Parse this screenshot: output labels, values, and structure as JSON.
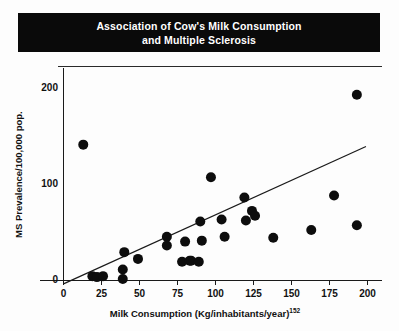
{
  "title": {
    "line1": "Association of Cow's Milk Consumption",
    "line2": "and Multiple Sclerosis",
    "background": "#0a0a0a",
    "color": "#ffffff"
  },
  "chart_data": {
    "type": "scatter",
    "title": "Association of Cow's Milk Consumption and Multiple Sclerosis",
    "xlabel": "Milk Consumption (Kg/inhabitants/year)",
    "xlabel_superscript": "152",
    "ylabel": "MS Prevalence/100,000 pop.",
    "xlim": [
      0,
      200
    ],
    "ylim": [
      0,
      220
    ],
    "xticks": [
      0,
      25,
      50,
      75,
      100,
      125,
      150,
      175,
      200
    ],
    "xticklabels": [
      "0",
      "25",
      "50",
      "75",
      "100",
      "125",
      "150",
      "175",
      "200"
    ],
    "yticks": [
      0,
      100,
      200
    ],
    "yticklabels": [
      "0",
      "100",
      "200"
    ],
    "grid": false,
    "legend": null,
    "marker_color": "#0d0d0d",
    "marker_size": 5,
    "points": [
      {
        "x": 13,
        "y": 141
      },
      {
        "x": 19,
        "y": 4
      },
      {
        "x": 22,
        "y": 3
      },
      {
        "x": 26,
        "y": 4
      },
      {
        "x": 39,
        "y": 11
      },
      {
        "x": 39,
        "y": 1
      },
      {
        "x": 40,
        "y": 29
      },
      {
        "x": 49,
        "y": 22
      },
      {
        "x": 68,
        "y": 45
      },
      {
        "x": 68,
        "y": 36
      },
      {
        "x": 78,
        "y": 19
      },
      {
        "x": 80,
        "y": 40
      },
      {
        "x": 83,
        "y": 20
      },
      {
        "x": 84,
        "y": 20
      },
      {
        "x": 89,
        "y": 19
      },
      {
        "x": 90,
        "y": 61
      },
      {
        "x": 91,
        "y": 41
      },
      {
        "x": 97,
        "y": 107
      },
      {
        "x": 104,
        "y": 63
      },
      {
        "x": 106,
        "y": 45
      },
      {
        "x": 119,
        "y": 86
      },
      {
        "x": 120,
        "y": 62
      },
      {
        "x": 124,
        "y": 72
      },
      {
        "x": 126,
        "y": 67
      },
      {
        "x": 138,
        "y": 44
      },
      {
        "x": 163,
        "y": 52
      },
      {
        "x": 178,
        "y": 88
      },
      {
        "x": 193,
        "y": 193
      },
      {
        "x": 193,
        "y": 57
      }
    ],
    "trend_line": {
      "label": "linear-fit",
      "x_start": 0,
      "y_start": -4,
      "x_end": 199,
      "y_end": 139,
      "color": "#1a1a1a"
    }
  },
  "axis": {
    "y_title": "MS Prevalence/100,000 pop.",
    "x_title_main": "Milk Consumption (Kg/inhabitants/year)",
    "x_title_sup": "152"
  }
}
